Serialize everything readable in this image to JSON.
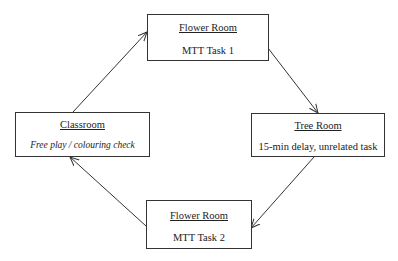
{
  "diagram": {
    "nodes": [
      {
        "id": "flower1",
        "title": "Flower Room",
        "subtitle": "MTT Task 1",
        "italic": false
      },
      {
        "id": "tree",
        "title": "Tree Room",
        "subtitle": "15-min delay, unrelated task",
        "italic": false
      },
      {
        "id": "flower2",
        "title": "Flower Room",
        "subtitle": "MTT Task 2",
        "italic": false
      },
      {
        "id": "classroom",
        "title": "Classroom",
        "subtitle": "Free play / colouring check",
        "italic": true
      }
    ],
    "edges": [
      {
        "from": "classroom",
        "to": "flower1"
      },
      {
        "from": "flower1",
        "to": "tree"
      },
      {
        "from": "tree",
        "to": "flower2"
      },
      {
        "from": "flower2",
        "to": "classroom"
      }
    ],
    "colors": {
      "line": "#333333",
      "background": "#ffffff"
    }
  }
}
